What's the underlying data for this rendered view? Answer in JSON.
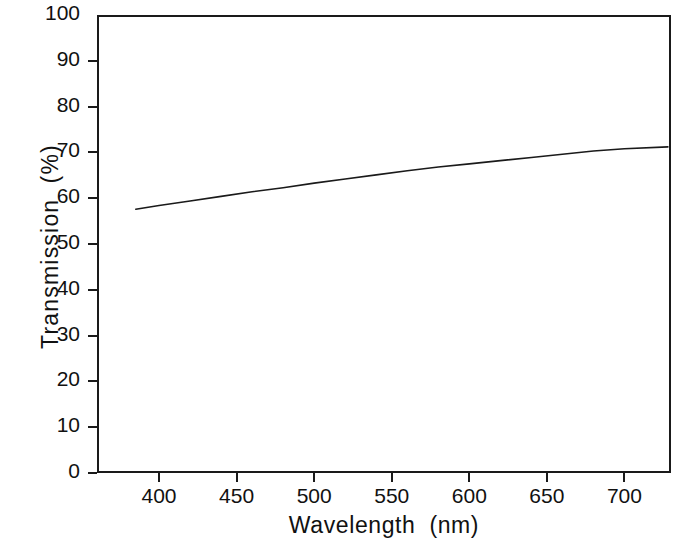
{
  "chart_data": {
    "type": "line",
    "title": "",
    "xlabel": "Wavelength  (nm)",
    "ylabel": "Transmission  (%)",
    "xlim": [
      360,
      730
    ],
    "ylim": [
      0,
      100
    ],
    "xticks": [
      400,
      450,
      500,
      550,
      600,
      650,
      700
    ],
    "xtick_labels": [
      "400",
      "450",
      "500",
      "550",
      "600",
      "650",
      "700"
    ],
    "yticks": [
      0,
      10,
      20,
      30,
      40,
      50,
      60,
      70,
      80,
      90,
      100
    ],
    "ytick_labels": [
      "0",
      "10",
      "20",
      "30",
      "40",
      "50",
      "60",
      "70",
      "80",
      "90",
      "100"
    ],
    "grid": false,
    "legend": null,
    "series": [
      {
        "name": "Transmission",
        "color": "#1a1a1a",
        "line_width": 1.6,
        "x": [
          385,
          400,
          420,
          440,
          460,
          480,
          500,
          520,
          540,
          560,
          580,
          600,
          620,
          640,
          660,
          680,
          700,
          728
        ],
        "y": [
          57.6,
          58.4,
          59.4,
          60.4,
          61.4,
          62.3,
          63.3,
          64.2,
          65.1,
          66.0,
          66.8,
          67.5,
          68.2,
          68.9,
          69.6,
          70.3,
          70.8,
          71.2
        ]
      }
    ],
    "axis_color": "#1a1a1a",
    "background": "#ffffff"
  },
  "figure": {
    "xlabel_text": "Wavelength  (nm)",
    "ylabel_text": "Transmission  (%)"
  }
}
